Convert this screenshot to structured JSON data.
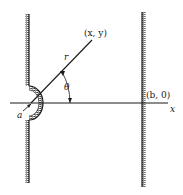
{
  "diagram": {
    "labels": {
      "point": "(x, y)",
      "radius": "r",
      "angle": "θ",
      "circle_radius": "a",
      "wall_point": "(b, 0)",
      "x_axis": "x"
    },
    "colors": {
      "ink": "#1a1a1a",
      "background": "#ffffff"
    }
  }
}
